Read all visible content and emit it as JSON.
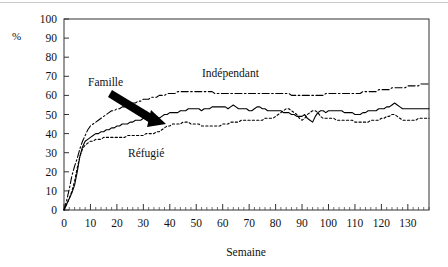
{
  "chart_data": {
    "type": "line",
    "title": "",
    "xlabel": "Semaine",
    "ylabel": "%",
    "xlim": [
      0,
      138
    ],
    "ylim": [
      0,
      100
    ],
    "grid": false,
    "legend_position": "inline-annotations",
    "xticks": [
      0,
      10,
      20,
      30,
      40,
      50,
      60,
      70,
      80,
      90,
      100,
      110,
      120,
      130
    ],
    "yticks": [
      0,
      10,
      20,
      30,
      40,
      50,
      60,
      70,
      80,
      90,
      100
    ],
    "x_minor_tick_interval": 2,
    "annotations": [
      {
        "text": "Famille",
        "series": "Famille",
        "has_arrow": true
      },
      {
        "text": "Indépendant",
        "series": "Indépendant",
        "has_arrow": false
      },
      {
        "text": "Réfugié",
        "series": "Réfugié",
        "has_arrow": false
      }
    ],
    "series": [
      {
        "name": "Famille",
        "style": "solid",
        "color": "#000000",
        "x": [
          0,
          1,
          2,
          3,
          4,
          5,
          6,
          7,
          8,
          9,
          10,
          11,
          12,
          13,
          14,
          15,
          16,
          17,
          18,
          19,
          20,
          21,
          22,
          23,
          24,
          25,
          26,
          27,
          28,
          29,
          30,
          31,
          32,
          33,
          34,
          35,
          36,
          37,
          38,
          39,
          40,
          41,
          42,
          43,
          44,
          45,
          46,
          47,
          48,
          49,
          50,
          51,
          52,
          53,
          54,
          55,
          56,
          57,
          58,
          59,
          60,
          61,
          62,
          63,
          64,
          65,
          66,
          67,
          68,
          69,
          70,
          71,
          72,
          73,
          74,
          75,
          76,
          77,
          78,
          79,
          80,
          81,
          82,
          83,
          84,
          85,
          86,
          87,
          88,
          89,
          90,
          91,
          92,
          93,
          94,
          95,
          96,
          97,
          98,
          99,
          100,
          101,
          102,
          103,
          104,
          105,
          106,
          107,
          108,
          109,
          110,
          111,
          112,
          113,
          114,
          115,
          116,
          117,
          118,
          119,
          120,
          121,
          122,
          123,
          124,
          125,
          126,
          127,
          128,
          129,
          130,
          131,
          132,
          133,
          134,
          135,
          136,
          137,
          138
        ],
        "y": [
          0,
          3,
          6,
          9,
          13,
          20,
          28,
          33,
          36,
          37,
          38,
          39,
          40,
          40,
          41,
          41,
          42,
          42,
          43,
          43,
          44,
          44,
          45,
          45,
          45,
          46,
          46,
          47,
          47,
          47,
          48,
          48,
          48,
          49,
          49,
          49,
          48,
          49,
          50,
          50,
          51,
          51,
          51,
          51,
          52,
          52,
          52,
          53,
          53,
          53,
          53,
          53,
          52,
          53,
          53,
          53,
          54,
          54,
          54,
          54,
          54,
          54,
          53,
          54,
          55,
          54,
          53,
          53,
          53,
          53,
          52,
          52,
          53,
          54,
          54,
          53,
          53,
          52,
          52,
          52,
          52,
          52,
          52,
          51,
          51,
          51,
          50,
          50,
          49,
          49,
          49,
          50,
          48,
          47,
          46,
          49,
          51,
          52,
          52,
          51,
          52,
          52,
          52,
          52,
          52,
          52,
          51,
          51,
          51,
          51,
          50,
          50,
          50,
          51,
          51,
          52,
          52,
          52,
          52,
          53,
          53,
          53,
          54,
          54,
          55,
          56,
          55,
          54,
          53,
          53,
          53,
          53,
          53,
          53,
          53,
          53,
          53,
          53,
          53
        ]
      },
      {
        "name": "Indépendant",
        "style": "dash-dot",
        "color": "#000000",
        "x": [
          0,
          1,
          2,
          3,
          4,
          5,
          6,
          7,
          8,
          9,
          10,
          11,
          12,
          13,
          14,
          15,
          16,
          17,
          18,
          19,
          20,
          21,
          22,
          23,
          24,
          25,
          26,
          27,
          28,
          29,
          30,
          31,
          32,
          33,
          34,
          35,
          36,
          37,
          38,
          39,
          40,
          41,
          42,
          43,
          44,
          45,
          46,
          47,
          48,
          49,
          50,
          51,
          52,
          53,
          54,
          55,
          56,
          57,
          58,
          59,
          60,
          61,
          62,
          63,
          64,
          65,
          66,
          67,
          68,
          69,
          70,
          71,
          72,
          73,
          74,
          75,
          76,
          77,
          78,
          79,
          80,
          81,
          82,
          83,
          84,
          85,
          86,
          87,
          88,
          89,
          90,
          91,
          92,
          93,
          94,
          95,
          96,
          97,
          98,
          99,
          100,
          101,
          102,
          103,
          104,
          105,
          106,
          107,
          108,
          109,
          110,
          111,
          112,
          113,
          114,
          115,
          116,
          117,
          118,
          119,
          120,
          121,
          122,
          123,
          124,
          125,
          126,
          127,
          128,
          129,
          130,
          131,
          132,
          133,
          134,
          135,
          136,
          137,
          138
        ],
        "y": [
          0,
          5,
          11,
          18,
          23,
          27,
          32,
          36,
          39,
          42,
          44,
          45,
          46,
          47,
          48,
          49,
          50,
          51,
          52,
          52,
          53,
          53,
          54,
          54,
          55,
          55,
          56,
          56,
          57,
          57,
          58,
          58,
          58,
          59,
          59,
          59,
          60,
          60,
          60,
          61,
          61,
          61,
          61,
          62,
          62,
          62,
          62,
          62,
          62,
          62,
          62,
          62,
          62,
          62,
          62,
          62,
          62,
          61,
          61,
          61,
          61,
          61,
          61,
          61,
          61,
          61,
          61,
          61,
          61,
          61,
          61,
          61,
          61,
          61,
          61,
          61,
          61,
          61,
          61,
          61,
          61,
          61,
          61,
          61,
          61,
          61,
          60,
          60,
          60,
          60,
          60,
          60,
          60,
          60,
          60,
          60,
          60,
          60,
          60,
          61,
          61,
          61,
          61,
          61,
          61,
          61,
          61,
          61,
          61,
          61,
          61,
          61,
          61,
          62,
          62,
          62,
          62,
          62,
          62,
          63,
          63,
          63,
          63,
          63,
          64,
          64,
          64,
          64,
          64,
          64,
          65,
          65,
          65,
          65,
          65,
          66,
          66,
          66,
          66
        ]
      },
      {
        "name": "Réfugié",
        "style": "dotted",
        "color": "#000000",
        "x": [
          0,
          1,
          2,
          3,
          4,
          5,
          6,
          7,
          8,
          9,
          10,
          11,
          12,
          13,
          14,
          15,
          16,
          17,
          18,
          19,
          20,
          21,
          22,
          23,
          24,
          25,
          26,
          27,
          28,
          29,
          30,
          31,
          32,
          33,
          34,
          35,
          36,
          37,
          38,
          39,
          40,
          41,
          42,
          43,
          44,
          45,
          46,
          47,
          48,
          49,
          50,
          51,
          52,
          53,
          54,
          55,
          56,
          57,
          58,
          59,
          60,
          61,
          62,
          63,
          64,
          65,
          66,
          67,
          68,
          69,
          70,
          71,
          72,
          73,
          74,
          75,
          76,
          77,
          78,
          79,
          80,
          81,
          82,
          83,
          84,
          85,
          86,
          87,
          88,
          89,
          90,
          91,
          92,
          93,
          94,
          95,
          96,
          97,
          98,
          99,
          100,
          101,
          102,
          103,
          104,
          105,
          106,
          107,
          108,
          109,
          110,
          111,
          112,
          113,
          114,
          115,
          116,
          117,
          118,
          119,
          120,
          121,
          122,
          123,
          124,
          125,
          126,
          127,
          128,
          129,
          130,
          131,
          132,
          133,
          134,
          135,
          136,
          137,
          138
        ],
        "y": [
          0,
          3,
          6,
          10,
          15,
          22,
          28,
          32,
          34,
          35,
          36,
          36,
          37,
          37,
          37,
          38,
          38,
          38,
          38,
          38,
          38,
          38,
          38,
          38,
          39,
          39,
          39,
          39,
          39,
          39,
          39,
          40,
          40,
          40,
          40,
          41,
          41,
          42,
          43,
          44,
          44,
          45,
          45,
          45,
          45,
          46,
          46,
          46,
          45,
          45,
          45,
          45,
          44,
          44,
          44,
          44,
          44,
          44,
          44,
          44,
          45,
          45,
          45,
          46,
          46,
          46,
          46,
          47,
          47,
          47,
          47,
          47,
          47,
          47,
          47,
          47,
          48,
          48,
          48,
          48,
          49,
          50,
          51,
          52,
          53,
          53,
          52,
          51,
          50,
          48,
          47,
          48,
          50,
          51,
          52,
          52,
          51,
          49,
          48,
          48,
          48,
          48,
          48,
          47,
          47,
          47,
          47,
          47,
          47,
          47,
          46,
          46,
          46,
          46,
          46,
          46,
          47,
          47,
          47,
          47,
          48,
          48,
          49,
          49,
          50,
          50,
          49,
          48,
          47,
          47,
          47,
          47,
          47,
          47,
          48,
          48,
          48,
          48,
          48
        ]
      }
    ]
  },
  "axis": {
    "y_unit_label": "%",
    "x_title": "Semaine",
    "ytick_labels": [
      "100",
      "90",
      "80",
      "70",
      "60",
      "50",
      "40",
      "30",
      "20",
      "10",
      "0"
    ],
    "xtick_labels": [
      "0",
      "10",
      "20",
      "30",
      "40",
      "50",
      "60",
      "70",
      "80",
      "90",
      "100",
      "110",
      "120",
      "130"
    ]
  },
  "labels": {
    "famille": "Famille",
    "independant": "Indépendant",
    "refugie": "Réfugié"
  }
}
